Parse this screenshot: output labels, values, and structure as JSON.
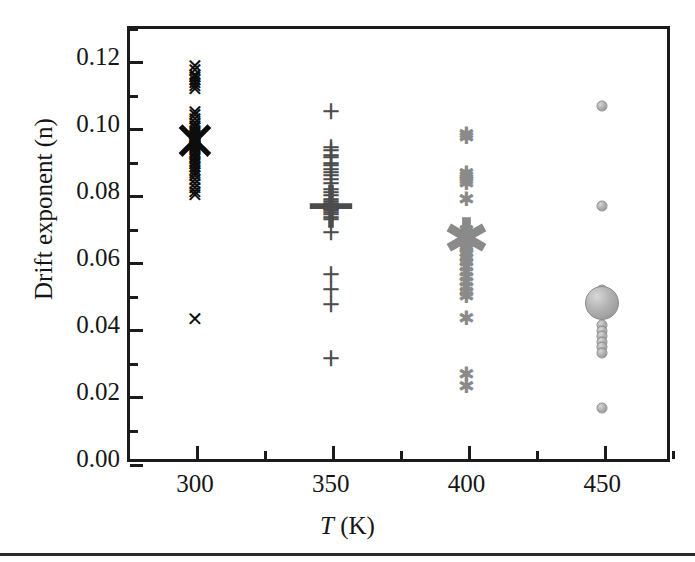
{
  "figure": {
    "background_color": "#ffffff",
    "frame_color": "#1b1b1b",
    "bottom_rule": true
  },
  "axes": {
    "y_title": "Drift exponent (n)",
    "x_title_symbol": "T",
    "x_title_unit": " (K)"
  },
  "chart_data": {
    "type": "scatter",
    "title": "",
    "subtitle": "",
    "xlabel": "T (K)",
    "ylabel": "Drift exponent (n)",
    "xlim": [
      275,
      475
    ],
    "ylim": [
      0.0,
      0.13
    ],
    "grid": false,
    "legend": "none",
    "x_ticks_major": [
      300,
      350,
      400,
      450
    ],
    "x_ticks_major_labels": [
      "300",
      "350",
      "400",
      "450"
    ],
    "x_ticks_minor": [
      325,
      375,
      425,
      475
    ],
    "y_ticks_major": [
      0.0,
      0.02,
      0.04,
      0.06,
      0.08,
      0.1,
      0.12
    ],
    "y_ticks_major_labels": [
      "0.00",
      "0.02",
      "0.04",
      "0.06",
      "0.08",
      "0.10",
      "0.12"
    ],
    "y_ticks_minor": [
      0.01,
      0.03,
      0.05,
      0.07,
      0.09,
      0.11,
      0.13
    ],
    "series": [
      {
        "name": "300 K",
        "marker": "cross",
        "color": "#0d0d0d",
        "x": 300,
        "values": [
          0.118,
          0.1168,
          0.1155,
          0.1148,
          0.114,
          0.113,
          0.1122,
          0.1112,
          0.1045,
          0.1035,
          0.1022,
          0.1012,
          0.1002,
          0.0995,
          0.0988,
          0.0982,
          0.0975,
          0.097,
          0.0968,
          0.0965,
          0.0962,
          0.096,
          0.0958,
          0.0955,
          0.0952,
          0.095,
          0.0948,
          0.0945,
          0.0942,
          0.0938,
          0.0932,
          0.0925,
          0.0918,
          0.091,
          0.0902,
          0.0895,
          0.0888,
          0.088,
          0.0872,
          0.0862,
          0.0852,
          0.0842,
          0.083,
          0.0818,
          0.0805,
          0.0795,
          0.0425
        ],
        "mean": 0.0955,
        "outlier": 0.0425
      },
      {
        "name": "350 K",
        "marker": "plus",
        "color": "#4c4c4c",
        "x": 350,
        "values": [
          0.1045,
          0.0935,
          0.0928,
          0.0912,
          0.0905,
          0.089,
          0.0882,
          0.087,
          0.0862,
          0.0852,
          0.0842,
          0.0828,
          0.0812,
          0.0802,
          0.0792,
          0.0782,
          0.0775,
          0.0768,
          0.0762,
          0.076,
          0.0758,
          0.0755,
          0.0752,
          0.0748,
          0.0742,
          0.0735,
          0.0728,
          0.0722,
          0.0682,
          0.0558,
          0.0512,
          0.0468,
          0.0308
        ],
        "mean": 0.0758
      },
      {
        "name": "400 K",
        "marker": "asterisk",
        "color": "#8a8a8a",
        "x": 400,
        "values": [
          0.0978,
          0.0968,
          0.0862,
          0.0852,
          0.0842,
          0.0832,
          0.0785,
          0.0692,
          0.0682,
          0.0675,
          0.0668,
          0.0662,
          0.0658,
          0.0652,
          0.0645,
          0.0635,
          0.0622,
          0.0608,
          0.0595,
          0.0582,
          0.0568,
          0.0552,
          0.0538,
          0.0522,
          0.0508,
          0.0495,
          0.0428,
          0.0262,
          0.0228
        ],
        "mean": 0.0665
      },
      {
        "name": "450 K",
        "marker": "circle",
        "color": "#a8a8a8",
        "x": 450,
        "values": [
          0.1062,
          0.0762,
          0.0512,
          0.0488,
          0.0472,
          0.0462,
          0.0408,
          0.0392,
          0.0375,
          0.0358,
          0.0342,
          0.0325,
          0.0162
        ],
        "mean": 0.0475
      }
    ]
  }
}
